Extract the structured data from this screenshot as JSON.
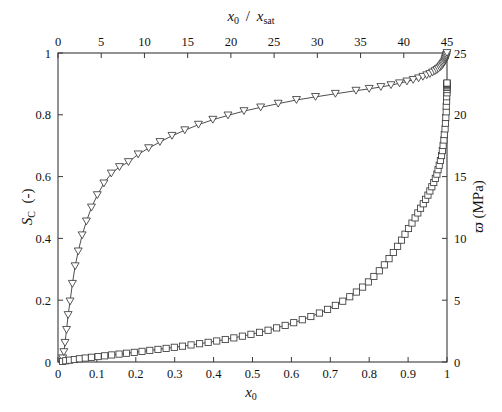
{
  "figure": {
    "background_color": "#ffffff",
    "line_color": "#3a3a3a",
    "marker_edge_color": "#3a3a3a",
    "marker_face_color": "#ffffff"
  },
  "labels": {
    "bottom_axis": "x0",
    "top_axis": "x0 / xsat",
    "left_axis": "SC (-)",
    "right_axis": "ϖ (MPa)"
  },
  "chart_data": {
    "type": "line",
    "title": "",
    "xlabel": "x_0",
    "ylabel": "S_C (-)",
    "y2label": "ϖ (MPa)",
    "top_xlabel": "x_0 / x_sat",
    "grid": false,
    "legend": null,
    "xlim": [
      0,
      1
    ],
    "ylim": [
      0,
      1
    ],
    "y2lim": [
      0,
      25
    ],
    "top_xlim": [
      0,
      45
    ],
    "xticks": [
      0,
      0.1,
      0.2,
      0.3,
      0.4,
      0.5,
      0.6,
      0.7,
      0.8,
      0.9,
      1
    ],
    "xticklabels": [
      "0",
      "0.1",
      "0.2",
      "0.3",
      "0.4",
      "0.5",
      "0.6",
      "0.7",
      "0.8",
      "0.9",
      "1"
    ],
    "yticks": [
      0,
      0.2,
      0.4,
      0.6,
      0.8,
      1
    ],
    "yticklabels": [
      "0",
      "0.2",
      "0.4",
      "0.6",
      "0.8",
      "1"
    ],
    "y2ticks": [
      0,
      5,
      10,
      15,
      20,
      25
    ],
    "y2ticklabels": [
      "0",
      "5",
      "10",
      "15",
      "20",
      "25"
    ],
    "top_xticks": [
      0,
      5,
      10,
      15,
      20,
      25,
      30,
      35,
      40,
      45
    ],
    "top_xticklabels": [
      "0",
      "5",
      "10",
      "15",
      "20",
      "25",
      "30",
      "35",
      "40",
      "45"
    ],
    "series": [
      {
        "name": "S_C",
        "axis": "left",
        "marker": "triangle-down",
        "x": [
          0.012,
          0.015,
          0.018,
          0.022,
          0.026,
          0.031,
          0.037,
          0.044,
          0.052,
          0.062,
          0.073,
          0.086,
          0.101,
          0.118,
          0.137,
          0.158,
          0.181,
          0.206,
          0.233,
          0.262,
          0.293,
          0.326,
          0.361,
          0.398,
          0.437,
          0.478,
          0.521,
          0.566,
          0.613,
          0.662,
          0.713,
          0.766,
          0.8,
          0.83,
          0.856,
          0.878,
          0.897,
          0.913,
          0.927,
          0.938,
          0.948,
          0.956,
          0.963,
          0.969,
          0.974,
          0.978,
          0.982,
          0.985,
          0.988,
          0.99,
          0.992,
          0.994,
          0.995,
          0.996,
          0.997,
          0.998,
          0.999,
          1.0
        ],
        "y": [
          0.012,
          0.032,
          0.062,
          0.104,
          0.152,
          0.196,
          0.253,
          0.31,
          0.358,
          0.41,
          0.455,
          0.5,
          0.54,
          0.578,
          0.61,
          0.631,
          0.647,
          0.672,
          0.692,
          0.712,
          0.732,
          0.75,
          0.768,
          0.784,
          0.798,
          0.812,
          0.824,
          0.836,
          0.848,
          0.858,
          0.868,
          0.878,
          0.884,
          0.89,
          0.896,
          0.902,
          0.908,
          0.913,
          0.918,
          0.923,
          0.928,
          0.932,
          0.937,
          0.941,
          0.945,
          0.949,
          0.953,
          0.957,
          0.961,
          0.965,
          0.969,
          0.973,
          0.977,
          0.981,
          0.985,
          0.989,
          0.994,
          1.0
        ]
      },
      {
        "name": "ϖ",
        "axis": "right",
        "marker": "square",
        "x": [
          0.012,
          0.02,
          0.03,
          0.042,
          0.055,
          0.07,
          0.086,
          0.103,
          0.12,
          0.138,
          0.157,
          0.176,
          0.196,
          0.216,
          0.236,
          0.257,
          0.278,
          0.299,
          0.32,
          0.342,
          0.364,
          0.386,
          0.408,
          0.43,
          0.452,
          0.474,
          0.496,
          0.518,
          0.54,
          0.562,
          0.584,
          0.606,
          0.628,
          0.65,
          0.672,
          0.693,
          0.713,
          0.732,
          0.75,
          0.767,
          0.783,
          0.798,
          0.812,
          0.826,
          0.839,
          0.851,
          0.862,
          0.873,
          0.883,
          0.892,
          0.901,
          0.91,
          0.918,
          0.925,
          0.932,
          0.939,
          0.945,
          0.951,
          0.956,
          0.961,
          0.966,
          0.97,
          0.974,
          0.977,
          0.98,
          0.983,
          0.986,
          0.988,
          0.99,
          0.992,
          0.993,
          0.995,
          0.996,
          0.997,
          0.998,
          0.998,
          0.999,
          0.999,
          1.0,
          1.0,
          1.0,
          1.0,
          1.0,
          1.0,
          1.0,
          1.0,
          1.0
        ],
        "y": [
          0.05,
          0.1,
          0.15,
          0.2,
          0.26,
          0.32,
          0.38,
          0.44,
          0.5,
          0.57,
          0.64,
          0.71,
          0.78,
          0.86,
          0.94,
          1.02,
          1.1,
          1.19,
          1.28,
          1.38,
          1.48,
          1.59,
          1.7,
          1.82,
          1.95,
          2.09,
          2.24,
          2.4,
          2.57,
          2.76,
          2.96,
          3.18,
          3.42,
          3.68,
          3.96,
          4.26,
          4.58,
          4.92,
          5.28,
          5.66,
          6.06,
          6.48,
          6.92,
          7.38,
          7.86,
          8.36,
          8.86,
          9.36,
          9.86,
          10.34,
          10.8,
          11.24,
          11.66,
          12.06,
          12.44,
          12.8,
          13.16,
          13.5,
          13.84,
          14.18,
          14.52,
          14.86,
          15.2,
          15.56,
          15.92,
          16.3,
          16.7,
          17.1,
          17.52,
          17.96,
          18.4,
          18.86,
          19.32,
          19.78,
          20.24,
          20.7,
          21.1,
          21.46,
          21.78,
          22.04,
          22.22,
          22.34,
          22.42,
          22.48,
          22.52,
          22.55,
          22.57
        ]
      }
    ]
  }
}
